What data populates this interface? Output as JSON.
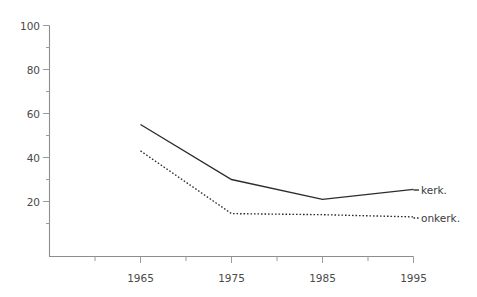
{
  "chart_data": {
    "type": "line",
    "title": "",
    "subtitle": "",
    "xlabel": "",
    "ylabel": "",
    "x": [
      1965,
      1975,
      1985,
      1995
    ],
    "categories": [
      "1965",
      "1975",
      "1985",
      "1995"
    ],
    "xlim": [
      1961,
      1995
    ],
    "ylim": [
      0,
      100
    ],
    "grid": false,
    "legend_position": "right-inline",
    "y_ticks": [
      20,
      40,
      60,
      80,
      100
    ],
    "y_tick_labels": [
      "20",
      "40",
      "60",
      "80",
      "100"
    ],
    "y_minor_tick_values": [
      10,
      30,
      50,
      70,
      90
    ],
    "x_ticks": [
      1965,
      1975,
      1985,
      1995
    ],
    "x_tick_labels": [
      "1965",
      "1975",
      "1985",
      "1995"
    ],
    "x_minor_tick_values": [
      1962.5,
      1967.5,
      1972.5,
      1977.5,
      1982.5,
      1987.5,
      1992.5
    ],
    "series": [
      {
        "name": "kerk.",
        "style": "solid",
        "color": "#2c2c2c",
        "values": [
          55,
          30,
          21,
          25.5
        ]
      },
      {
        "name": "onkerk.",
        "style": "dotted",
        "color": "#2c2c2c",
        "values": [
          43,
          14.5,
          14,
          13
        ]
      }
    ],
    "annotations": [
      {
        "name": "kerk.",
        "x": 1995,
        "y": 25.5
      },
      {
        "name": "onkerk.",
        "x": 1995,
        "y": 13
      }
    ],
    "colors": {
      "axis": "#8d8d8d",
      "tick": "#9a9a9a",
      "text": "#3b3b3b",
      "line": "#2c2c2c",
      "background": "#ffffff"
    }
  },
  "labels": {
    "y_100": "100",
    "y_80": "80",
    "y_60": "60",
    "y_40": "40",
    "y_20": "20",
    "x_1965": "1965",
    "x_1975": "1975",
    "x_1985": "1985",
    "x_1995": "1995",
    "legend_kerk": "kerk.",
    "legend_onkerk": "onkerk."
  }
}
